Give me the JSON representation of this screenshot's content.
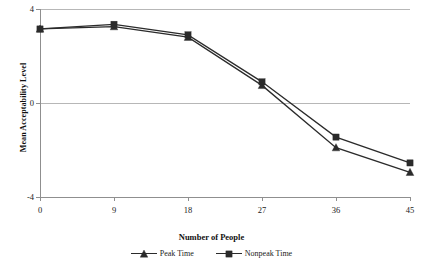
{
  "chart_data": {
    "type": "line",
    "title": "",
    "xlabel": "Number of People",
    "ylabel": "Mean Acceptability Level",
    "x": [
      0,
      9,
      18,
      27,
      36,
      45
    ],
    "categories": [
      "0",
      "9",
      "18",
      "27",
      "36",
      "45"
    ],
    "xlim": [
      0,
      45
    ],
    "ylim": [
      -4,
      4
    ],
    "ytick_labels": [
      "4",
      "0",
      "-4"
    ],
    "ytick_values": [
      4,
      0,
      -4
    ],
    "grid": true,
    "legend_position": "bottom",
    "series": [
      {
        "name": "Peak Time",
        "marker": "triangle",
        "color": "#2b2b2b",
        "values": [
          3.15,
          3.25,
          2.8,
          0.75,
          -1.9,
          -2.95
        ]
      },
      {
        "name": "Nonpeak Time",
        "marker": "square",
        "color": "#2b2b2b",
        "values": [
          3.15,
          3.35,
          2.9,
          0.9,
          -1.45,
          -2.55
        ]
      }
    ]
  },
  "axes": {
    "y_title": "Mean Acceptability Level",
    "x_title": "Number of People",
    "y_ticks": [
      "4",
      "0",
      "-4"
    ],
    "x_ticks": [
      "0",
      "9",
      "18",
      "27",
      "36",
      "45"
    ]
  },
  "legend": {
    "items": [
      {
        "label": "Peak Time",
        "marker": "triangle"
      },
      {
        "label": "Nonpeak Time",
        "marker": "square"
      }
    ]
  },
  "colors": {
    "line": "#2b2b2b",
    "grid": "#b7b7b7",
    "axis": "#8f8f8f",
    "text": "#1a1a1a",
    "background": "#ffffff"
  },
  "caption": ""
}
